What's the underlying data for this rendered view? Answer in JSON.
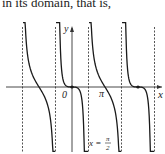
{
  "text": {
    "intro": "in its domain, that is,"
  },
  "chart_data": {
    "type": "line",
    "title": "",
    "xlabel": "x",
    "ylabel": "y",
    "origin_label": "0",
    "pi_label": "π",
    "asymptote_label": "x = π/2",
    "asymptote_label_parts": {
      "lhs": "x =",
      "num": "π",
      "den": "2"
    },
    "asymptotes_x": [
      -4.712,
      -1.571,
      1.571,
      4.712,
      7.854
    ],
    "zero_crossings": [
      {
        "x": -3.1416,
        "type": "steep"
      },
      {
        "x": 0,
        "type": "flat",
        "marked": true,
        "label": "0"
      },
      {
        "x": 3.1416,
        "type": "steep",
        "label": "π"
      },
      {
        "x": 6.2832,
        "type": "flat",
        "marked": true
      }
    ],
    "curve_description": "decreasing branches between vertical dashed asymptotes at odd multiples of π/2",
    "xlim": [
      -5.6,
      8.8
    ],
    "grid": false,
    "colors": {
      "curve": "#1a1a1a",
      "axis": "#333333",
      "asymptote": "#555555"
    }
  }
}
